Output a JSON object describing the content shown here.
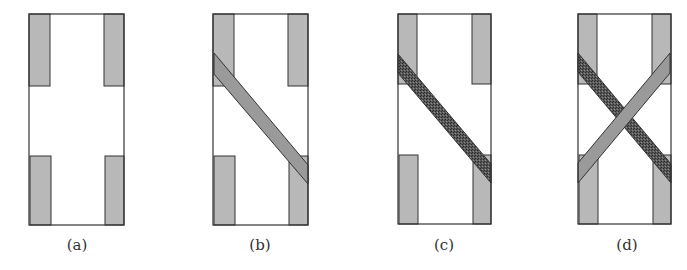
{
  "colors": {
    "background": "#ffffff",
    "outline": "#333333",
    "block_fill": "#b8b8b8",
    "strip_plain": "#9a9a9a",
    "strip_stipple_base": "#5a5a5a",
    "strip_stipple_dot": "#2a2a2a",
    "strip_stipple_light": "#8a8a8a"
  },
  "panels": [
    {
      "id": "a",
      "label": "(a)",
      "label_x": 77,
      "frame": {
        "x": 29,
        "y": 14,
        "w": 95,
        "h": 211
      },
      "blocks": [
        {
          "x": 29,
          "y": 14,
          "w": 21,
          "h": 72
        },
        {
          "x": 104,
          "y": 14,
          "w": 20,
          "h": 72
        },
        {
          "x": 30,
          "y": 156,
          "w": 21,
          "h": 69
        },
        {
          "x": 105,
          "y": 156,
          "w": 19,
          "h": 69
        }
      ],
      "strips": []
    },
    {
      "id": "b",
      "label": "(b)",
      "label_x": 260,
      "frame": {
        "x": 213,
        "y": 14,
        "w": 95,
        "h": 211
      },
      "blocks": [
        {
          "x": 213,
          "y": 14,
          "w": 21,
          "h": 72
        },
        {
          "x": 288,
          "y": 14,
          "w": 20,
          "h": 72
        },
        {
          "x": 214,
          "y": 156,
          "w": 21,
          "h": 69
        },
        {
          "x": 289,
          "y": 156,
          "w": 19,
          "h": 69
        }
      ],
      "strips": [
        {
          "style": "plain",
          "points": [
            [
              214,
              53
            ],
            [
              308,
              165
            ],
            [
              308,
              184
            ],
            [
              214,
              74
            ]
          ]
        }
      ]
    },
    {
      "id": "c",
      "label": "(c)",
      "label_x": 444,
      "frame": {
        "x": 398,
        "y": 14,
        "w": 93,
        "h": 210
      },
      "blocks": [
        {
          "x": 398,
          "y": 14,
          "w": 19,
          "h": 70
        },
        {
          "x": 472,
          "y": 14,
          "w": 19,
          "h": 70
        },
        {
          "x": 399,
          "y": 155,
          "w": 19,
          "h": 69
        },
        {
          "x": 473,
          "y": 155,
          "w": 18,
          "h": 69
        }
      ],
      "strips": [
        {
          "style": "stipple",
          "points": [
            [
              398,
              54
            ],
            [
              491,
              164
            ],
            [
              491,
              183
            ],
            [
              398,
              73
            ]
          ]
        }
      ]
    },
    {
      "id": "d",
      "label": "(d)",
      "label_x": 627,
      "frame": {
        "x": 578,
        "y": 14,
        "w": 93,
        "h": 210
      },
      "blocks": [
        {
          "x": 578,
          "y": 14,
          "w": 19,
          "h": 70
        },
        {
          "x": 652,
          "y": 14,
          "w": 19,
          "h": 70
        },
        {
          "x": 579,
          "y": 155,
          "w": 19,
          "h": 69
        },
        {
          "x": 653,
          "y": 155,
          "w": 18,
          "h": 69
        }
      ],
      "strips": [
        {
          "style": "stipple",
          "points": [
            [
              578,
              53
            ],
            [
              671,
              164
            ],
            [
              671,
              183
            ],
            [
              578,
              72
            ]
          ]
        },
        {
          "style": "plain",
          "points": [
            [
              578,
              163
            ],
            [
              670,
              53
            ],
            [
              670,
              73
            ],
            [
              578,
              183
            ]
          ]
        }
      ]
    }
  ]
}
